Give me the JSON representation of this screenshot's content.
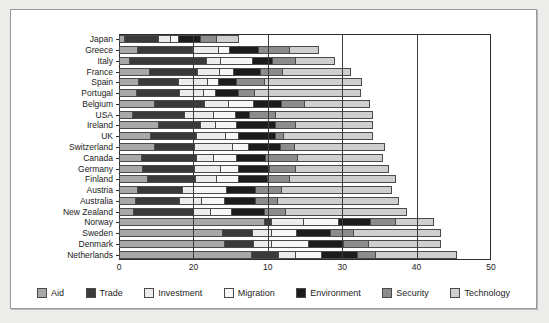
{
  "chart_data": {
    "type": "bar",
    "orientation": "horizontal",
    "stacked": true,
    "title": "",
    "subtitle": "",
    "xlabel": "",
    "ylabel": "",
    "xlim": [
      0,
      50
    ],
    "xticks": [
      0,
      20,
      10,
      30,
      40,
      50
    ],
    "xtick_positions": [
      0,
      10,
      20,
      30,
      40,
      50
    ],
    "grid": true,
    "gridlines_at": [
      10,
      20,
      30,
      40
    ],
    "legend_position": "bottom",
    "categories": [
      "Japan",
      "Greece",
      "Italy",
      "France",
      "Spain",
      "Portugal",
      "Belgium",
      "USA",
      "Ireland",
      "UK",
      "Switzerland",
      "Canada",
      "Germany",
      "Finland",
      "Austria",
      "Australia",
      "New Zealand",
      "Norway",
      "Sweden",
      "Denmark",
      "Netherlands"
    ],
    "series": [
      {
        "name": "Aid",
        "color": "#a8a8a8",
        "values": [
          0.8,
          2.6,
          1.5,
          4.2,
          2.7,
          2.4,
          4.8,
          1.9,
          5.4,
          4.3,
          4.8,
          3.1,
          3.2,
          3.9,
          2.6,
          2.3,
          2.0,
          19.6,
          14.0,
          14.2,
          17.9
        ]
      },
      {
        "name": "Trade",
        "color": "#3a3a3a",
        "values": [
          4.7,
          7.5,
          10.4,
          6.6,
          5.5,
          6.0,
          6.9,
          7.1,
          5.7,
          6.3,
          5.5,
          7.5,
          7.1,
          6.6,
          6.1,
          6.1,
          8.2,
          1.1,
          4.2,
          4.1,
          3.8
        ]
      },
      {
        "name": "Investment",
        "color": "#ececec",
        "values": [
          1.7,
          3.6,
          2.1,
          3.1,
          4.0,
          3.3,
          3.3,
          4.0,
          2.2,
          4.0,
          5.3,
          2.5,
          3.7,
          3.0,
          1.7,
          3.0,
          2.5,
          4.5,
          2.7,
          2.6,
          2.4
        ]
      },
      {
        "name": "Migration",
        "color": "#f7f7f7",
        "values": [
          1.3,
          1.6,
          4.4,
          2.0,
          1.6,
          1.7,
          3.5,
          3.1,
          3.0,
          1.9,
          2.3,
          3.2,
          2.5,
          3.1,
          4.5,
          3.2,
          2.9,
          4.8,
          3.4,
          5.0,
          3.6
        ]
      },
      {
        "name": "Environment",
        "color": "#1c1c1c",
        "values": [
          3.1,
          4.0,
          2.8,
          3.7,
          2.6,
          3.3,
          4.0,
          2.1,
          5.3,
          5.2,
          4.4,
          4.0,
          4.4,
          4.0,
          4.0,
          4.4,
          4.5,
          4.4,
          4.7,
          4.9,
          5.0
        ]
      },
      {
        "name": "Security",
        "color": "#8c8c8c",
        "values": [
          2.3,
          4.4,
          3.2,
          3.1,
          3.9,
          2.3,
          3.2,
          3.6,
          2.9,
          1.1,
          2.0,
          4.4,
          3.6,
          3.0,
          3.7,
          3.0,
          3.0,
          3.5,
          3.2,
          3.5,
          2.5
        ]
      },
      {
        "name": "Technology",
        "color": "#cfcfcf",
        "values": [
          3.1,
          4.0,
          5.5,
          9.3,
          13.2,
          14.3,
          8.8,
          13.2,
          10.4,
          12.2,
          12.2,
          11.6,
          12.6,
          14.4,
          14.9,
          16.5,
          16.4,
          5.2,
          11.9,
          9.8,
          11.1
        ]
      }
    ]
  },
  "legend": {
    "items": [
      {
        "label": "Aid",
        "color": "#a8a8a8"
      },
      {
        "label": "Trade",
        "color": "#3a3a3a"
      },
      {
        "label": "Investment",
        "color": "#ececec"
      },
      {
        "label": "Migration",
        "color": "#f7f7f7"
      },
      {
        "label": "Environment",
        "color": "#1c1c1c"
      },
      {
        "label": "Security",
        "color": "#8c8c8c"
      },
      {
        "label": "Technology",
        "color": "#cfcfcf"
      }
    ]
  },
  "colors": {
    "panel_background": "#ffffff",
    "page_background": "#ececeb",
    "panel_border": "#9a9a9a",
    "axis": "#2b2b2b",
    "gridline": "#3a3a3a",
    "text": "#222222"
  }
}
